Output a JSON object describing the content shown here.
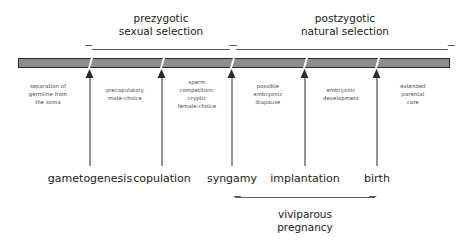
{
  "diagram": {
    "colors": {
      "bar_fill": "#8d8d8d",
      "bar_stroke": "#2b2b2b",
      "text": "#1a1a1a",
      "caption_text": "#3a3a3a",
      "bracket": "#5a5a5a",
      "background": "#ffffff"
    },
    "axis_bar": {
      "name": "reproductive-timeline-bar",
      "left_px": 18,
      "right_px": 450
    },
    "events": [
      {
        "id": "gametogenesis",
        "label": "gametogenesis",
        "x": 90,
        "caption": "separation of\ngermline from\nthe soma",
        "caption_side": "left",
        "caption_x": 12,
        "caption_y": 82,
        "caption_w": 72
      },
      {
        "id": "copulation",
        "label": "copulation",
        "x": 162,
        "caption": "precopulatory\nmate-choice",
        "caption_side": "left",
        "caption_x": 91,
        "caption_y": 86,
        "caption_w": 68
      },
      {
        "id": "syngamy",
        "label": "syngamy",
        "x": 232,
        "caption": "sperm\ncompetition;\ncryptic\nfemale-choice",
        "caption_side": "left",
        "caption_x": 166,
        "caption_y": 78,
        "caption_w": 62
      },
      {
        "id": "implantation",
        "label": "implantation",
        "x": 305,
        "caption": "possible\nembryonic\ndiapause",
        "caption_side": "left",
        "caption_x": 237,
        "caption_y": 82,
        "caption_w": 62
      },
      {
        "id": "birth",
        "label": "birth",
        "x": 377,
        "caption": "embryonic\ndevelopment",
        "caption_side": "left",
        "caption_x": 309,
        "caption_y": 86,
        "caption_w": 64
      },
      {
        "id": "post-birth",
        "label": "",
        "x": null,
        "caption": "extended\nparental\ncare",
        "caption_side": "right",
        "caption_x": 382,
        "caption_y": 82,
        "caption_w": 62
      }
    ],
    "stage_labels_y": 172,
    "groups": [
      {
        "id": "prezygotic",
        "title": "prezygotic\nsexual selection",
        "bracket_x": 88,
        "bracket_w": 146,
        "bracket_y": 45,
        "title_x": 88,
        "title_w": 146,
        "title_y": 12,
        "direction": "up"
      },
      {
        "id": "postzygotic",
        "title": "postzygotic\nnatural selection",
        "bracket_x": 232,
        "bracket_w": 220,
        "bracket_y": 45,
        "title_x": 240,
        "title_w": 210,
        "title_y": 12,
        "direction": "up"
      },
      {
        "id": "viviparous-pregnancy",
        "title": "viviparous\npregnancy",
        "bracket_x": 231,
        "bracket_w": 148,
        "bracket_y": 195,
        "title_x": 231,
        "title_w": 148,
        "title_y": 208,
        "direction": "down"
      }
    ]
  }
}
